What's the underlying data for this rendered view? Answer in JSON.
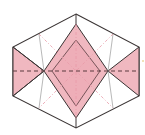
{
  "diagram": {
    "type": "origami-fold-step",
    "colors": {
      "paper_front": "#ffffff",
      "paper_back": "#f0b8c0",
      "outline": "#3a3434",
      "valley_fold": "#5a3a3e",
      "mountain_hint": "#e89aa8",
      "crease": "#9a9a9a",
      "accent_mark": "#e0c060"
    },
    "shapes": {
      "hexagon": "76,14 139,47 139,96 76,128 13,96 13,47",
      "left_flap": "13,47 44,71 13,96",
      "right_flap": "139,47 108,71 139,96",
      "center_diamond": "76,24 108,71 76,118 44,71",
      "inner_diamond": "76,40 98,71 76,104 54,71"
    }
  }
}
